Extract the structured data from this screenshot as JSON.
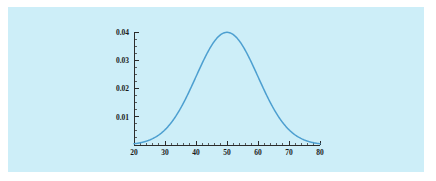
{
  "figure": {
    "panel_background": "#cdeef8",
    "page_background": "#ffffff"
  },
  "chart_data": {
    "type": "line",
    "title": "",
    "subtitle": "",
    "xlabel": "",
    "ylabel": "",
    "curve_name": "normal-density",
    "distribution": {
      "family": "normal",
      "mean": 50,
      "sigma": 10,
      "peak_value": 0.04
    },
    "xlim": [
      20,
      80
    ],
    "ylim": [
      0,
      0.0425
    ],
    "grid": false,
    "legend": null,
    "line_color": "#4d9fd0",
    "axis_color": "#2b2b2b",
    "x_ticks": [
      20,
      30,
      40,
      50,
      60,
      70,
      80
    ],
    "x_tick_labels": [
      "20",
      "30",
      "40",
      "50",
      "60",
      "70",
      "80"
    ],
    "x_minor_step": 2,
    "y_ticks": [
      0.01,
      0.02,
      0.03,
      0.04
    ],
    "y_tick_labels": [
      "0.01",
      "0.02",
      "0.03",
      "0.04"
    ],
    "y_minor_step": 0.0025,
    "x": [
      20,
      21,
      22,
      23,
      24,
      25,
      26,
      27,
      28,
      29,
      30,
      31,
      32,
      33,
      34,
      35,
      36,
      37,
      38,
      39,
      40,
      41,
      42,
      43,
      44,
      45,
      46,
      47,
      48,
      49,
      50,
      51,
      52,
      53,
      54,
      55,
      56,
      57,
      58,
      59,
      60,
      61,
      62,
      63,
      64,
      65,
      66,
      67,
      68,
      69,
      70,
      71,
      72,
      73,
      74,
      75,
      76,
      77,
      78,
      79,
      80
    ],
    "y": [
      0.00044,
      0.00058,
      0.00076,
      0.00099,
      0.00127,
      0.00163,
      0.00208,
      0.00262,
      0.00328,
      0.00407,
      0.00499,
      0.00605,
      0.00727,
      0.00863,
      0.01014,
      0.01179,
      0.01354,
      0.01539,
      0.0173,
      0.01923,
      0.02114,
      0.02299,
      0.02473,
      0.02632,
      0.02771,
      0.02887,
      0.02976,
      0.03036,
      0.03066,
      0.03065,
      0.03033,
      0.02971,
      0.02882,
      0.02768,
      0.02633,
      0.02481,
      0.02317,
      0.02145,
      0.01969,
      0.01793,
      0.01622,
      0.01456,
      0.013,
      0.01154,
      0.0102,
      0.00897,
      0.00785,
      0.00684,
      0.00595,
      0.00515,
      0.00444,
      0.00382,
      0.00327,
      0.00279,
      0.00238,
      0.00202,
      0.00171,
      0.00144,
      0.00121,
      0.00101,
      0.00085
    ]
  }
}
